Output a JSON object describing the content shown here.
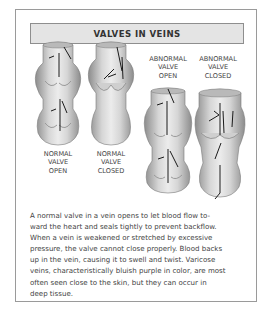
{
  "title": "VALVES IN VEINS",
  "figures": [
    {
      "id": "normal-open",
      "label_lines": [
        "NORMAL",
        "VALVE",
        "OPEN"
      ]
    },
    {
      "id": "normal-closed",
      "label_lines": [
        "NORMAL",
        "VALVE",
        "CLOSED"
      ]
    },
    {
      "id": "abnormal-open",
      "label_lines": [
        "ABNORMAL",
        "VALVE",
        "OPEN"
      ]
    },
    {
      "id": "abnormal-closed",
      "label_lines": [
        "ABNORMAL",
        "VALVE",
        "CLOSED"
      ]
    }
  ],
  "caption_lines": [
    "A normal valve in a vein opens to let blood flow to-",
    "ward the heart and seals tightly to prevent backflow.",
    "When a vein is weakened or stretched by excessive",
    "pressure, the valve cannot close properly. Blood backs",
    "up in the vein, causing it to swell and twist. Varicose",
    "veins, characteristically bluish purple in color, are most",
    "often seen close to the skin, but they can occur in",
    "deep tissue."
  ],
  "colors": {
    "border": "#9a9a9a",
    "title_bg": "#e4e4e4",
    "vein_light": "#d9d9d9",
    "vein_dark": "#8f8f8f",
    "arrow": "#1a1a1a"
  }
}
